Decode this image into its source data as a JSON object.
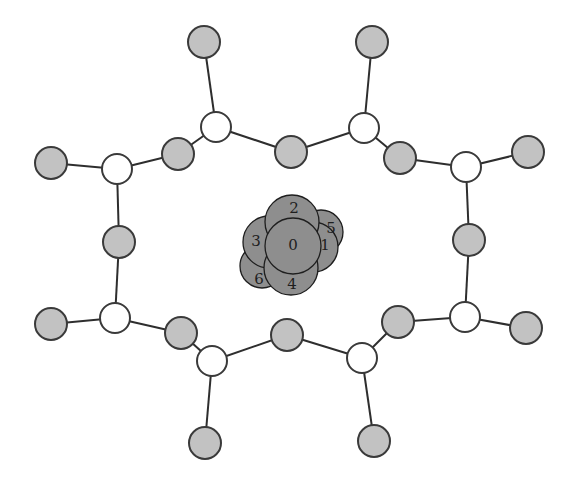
{
  "diagram": {
    "colors": {
      "background": "#ffffff",
      "gray_atom": "#c2c2c2",
      "white_atom": "#ffffff",
      "stroke": "#3a3a3a",
      "bond": "#2e2e2e",
      "cluster": "#8e8e8e"
    },
    "ring_nodes": [
      {
        "id": "w1",
        "type": "white",
        "x": 216,
        "y": 127,
        "r": 15
      },
      {
        "id": "w2",
        "type": "white",
        "x": 364,
        "y": 128,
        "r": 15
      },
      {
        "id": "w3",
        "type": "white",
        "x": 466,
        "y": 167,
        "r": 15
      },
      {
        "id": "w4",
        "type": "white",
        "x": 465,
        "y": 317,
        "r": 15
      },
      {
        "id": "w5",
        "type": "white",
        "x": 362,
        "y": 358,
        "r": 15
      },
      {
        "id": "w6",
        "type": "white",
        "x": 212,
        "y": 361,
        "r": 15
      },
      {
        "id": "w7",
        "type": "white",
        "x": 115,
        "y": 318,
        "r": 15
      },
      {
        "id": "w8",
        "type": "white",
        "x": 117,
        "y": 169,
        "r": 15
      },
      {
        "id": "g1",
        "type": "gray",
        "x": 291,
        "y": 152,
        "r": 16
      },
      {
        "id": "g2",
        "type": "gray",
        "x": 400,
        "y": 158,
        "r": 16
      },
      {
        "id": "g3",
        "type": "gray",
        "x": 469,
        "y": 240,
        "r": 16
      },
      {
        "id": "g4",
        "type": "gray",
        "x": 398,
        "y": 322,
        "r": 16
      },
      {
        "id": "g5",
        "type": "gray",
        "x": 287,
        "y": 335,
        "r": 16
      },
      {
        "id": "g6",
        "type": "gray",
        "x": 181,
        "y": 333,
        "r": 16
      },
      {
        "id": "g7",
        "type": "gray",
        "x": 119,
        "y": 242,
        "r": 16
      },
      {
        "id": "g8",
        "type": "gray",
        "x": 178,
        "y": 154,
        "r": 16
      }
    ],
    "terminal_nodes": [
      {
        "id": "t1",
        "type": "gray",
        "x": 204,
        "y": 42,
        "r": 16,
        "attached_to": "w1"
      },
      {
        "id": "t2",
        "type": "gray",
        "x": 372,
        "y": 42,
        "r": 16,
        "attached_to": "w2"
      },
      {
        "id": "t3",
        "type": "gray",
        "x": 528,
        "y": 152,
        "r": 16,
        "attached_to": "w3"
      },
      {
        "id": "t4",
        "type": "gray",
        "x": 526,
        "y": 328,
        "r": 16,
        "attached_to": "w4"
      },
      {
        "id": "t5",
        "type": "gray",
        "x": 374,
        "y": 441,
        "r": 16,
        "attached_to": "w5"
      },
      {
        "id": "t6",
        "type": "gray",
        "x": 205,
        "y": 443,
        "r": 16,
        "attached_to": "w6"
      },
      {
        "id": "t7",
        "type": "gray",
        "x": 51,
        "y": 324,
        "r": 16,
        "attached_to": "w7"
      },
      {
        "id": "t8",
        "type": "gray",
        "x": 51,
        "y": 163,
        "r": 16,
        "attached_to": "w8"
      }
    ],
    "ring_bonds": [
      [
        "w1",
        "g1"
      ],
      [
        "g1",
        "w2"
      ],
      [
        "w2",
        "g2"
      ],
      [
        "g2",
        "w3"
      ],
      [
        "w3",
        "g3"
      ],
      [
        "g3",
        "w4"
      ],
      [
        "w4",
        "g4"
      ],
      [
        "g4",
        "w5"
      ],
      [
        "w5",
        "g5"
      ],
      [
        "g5",
        "w6"
      ],
      [
        "w6",
        "g6"
      ],
      [
        "g6",
        "w7"
      ],
      [
        "w7",
        "g7"
      ],
      [
        "g7",
        "w8"
      ],
      [
        "w8",
        "g8"
      ],
      [
        "g8",
        "w1"
      ]
    ],
    "central_cluster": [
      {
        "label": "5",
        "x": 321,
        "y": 232,
        "r": 22,
        "lx": 331,
        "ly": 228
      },
      {
        "label": "6",
        "x": 262,
        "y": 266,
        "r": 22,
        "lx": 259,
        "ly": 279
      },
      {
        "label": "1",
        "x": 313,
        "y": 247,
        "r": 25,
        "lx": 325,
        "ly": 245
      },
      {
        "label": "3",
        "x": 269,
        "y": 242,
        "r": 26,
        "lx": 256,
        "ly": 241
      },
      {
        "label": "2",
        "x": 292,
        "y": 222,
        "r": 27,
        "lx": 294,
        "ly": 208
      },
      {
        "label": "4",
        "x": 291,
        "y": 268,
        "r": 27,
        "lx": 292,
        "ly": 284
      },
      {
        "label": "0",
        "x": 293,
        "y": 246,
        "r": 28,
        "lx": 293,
        "ly": 245
      }
    ]
  }
}
